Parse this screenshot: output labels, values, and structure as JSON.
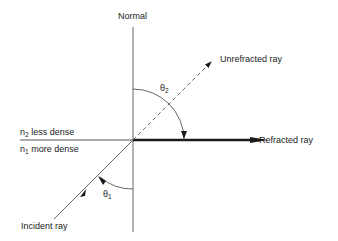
{
  "diagram": {
    "type": "refraction / total internal reflection at critical angle",
    "labels": {
      "normal": "Normal",
      "unrefracted_ray": "Unrefracted ray",
      "refracted_ray": "Refracted ray",
      "incident_ray": "Incident ray",
      "medium_top": {
        "symbol": "n",
        "subscript": "2",
        "text": " less dense"
      },
      "medium_bottom": {
        "symbol": "n",
        "subscript": "1",
        "text": " more dense"
      },
      "theta2": {
        "symbol": "θ",
        "subscript": "2"
      },
      "theta1": {
        "symbol": "θ",
        "subscript": "1"
      }
    },
    "colors": {
      "line": "#555555",
      "ray": "#1a1a1a",
      "background": "#ffffff"
    }
  }
}
